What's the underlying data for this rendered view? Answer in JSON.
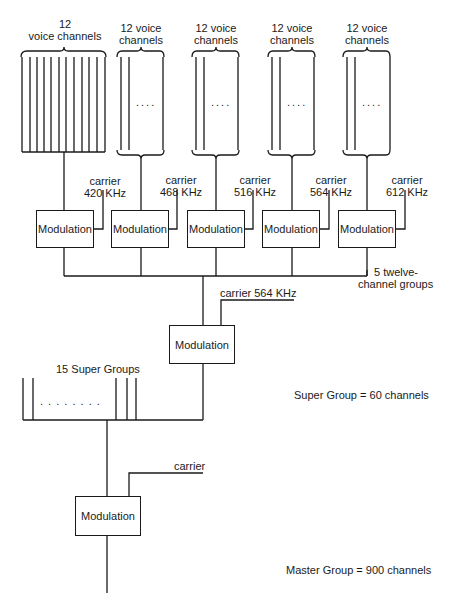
{
  "diagram": {
    "channel_groups": [
      {
        "label_line1": "12",
        "label_line2": "voice channels",
        "ellipsis": ""
      },
      {
        "label_line1": "12 voice",
        "label_line2": "channels",
        "ellipsis": "...."
      },
      {
        "label_line1": "12 voice",
        "label_line2": "channels",
        "ellipsis": "...."
      },
      {
        "label_line1": "12 voice",
        "label_line2": "channels",
        "ellipsis": "...."
      },
      {
        "label_line1": "12 voice",
        "label_line2": "channels",
        "ellipsis": "...."
      }
    ],
    "group_modulators": [
      {
        "label": "Modulation",
        "carrier_line1": "carrier",
        "carrier_line2": "420 KHz"
      },
      {
        "label": "Modulation",
        "carrier_line1": "carrier",
        "carrier_line2": "468 KHz"
      },
      {
        "label": "Modulation",
        "carrier_line1": "carrier",
        "carrier_line2": "516 KHz"
      },
      {
        "label": "Modulation",
        "carrier_line1": "carrier",
        "carrier_line2": "564 KHz"
      },
      {
        "label": "Modulation",
        "carrier_line1": "carrier",
        "carrier_line2": "612 KHz"
      }
    ],
    "groups_note_line1": "5 twelve-",
    "groups_note_line2": "channel groups",
    "super_modulator": {
      "label": "Modulation",
      "carrier": "carrier 564 KHz"
    },
    "super_groups_label": "15 Super Groups",
    "super_groups_ellipsis": ". . . . . . . .",
    "super_group_note": "Super Group = 60 channels",
    "master_modulator": {
      "label": "Modulation",
      "carrier": "carrier"
    },
    "master_group_note": "Master Group = 900 channels"
  }
}
